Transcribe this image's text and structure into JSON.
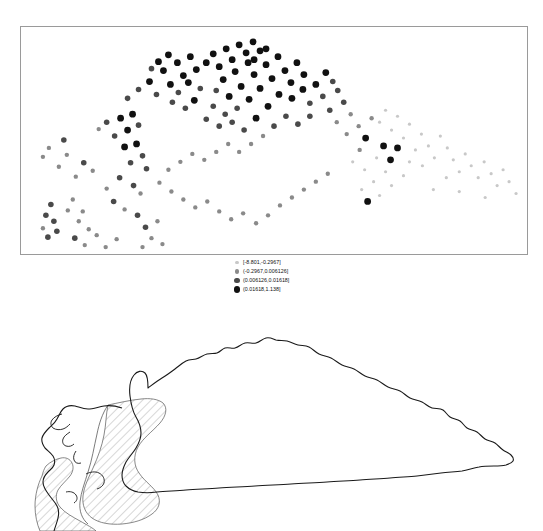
{
  "figure": {
    "title": "",
    "background_color": "#ffffff",
    "panel_border_color": "#9a9a9a",
    "map_outline_color": "#1a1a1a",
    "hatch_color": "#8c8c8c"
  },
  "legend": {
    "name": "choropleth-class-legend",
    "entries": [
      {
        "label": "[-8.801,-0.2967]",
        "marker": "circle",
        "color": "#c8c8c8",
        "size_px": 1.6
      },
      {
        "label": "(-0.2967,0.006126]",
        "marker": "circle",
        "color": "#8a8a8a",
        "size_px": 2.2
      },
      {
        "label": "(0.006126,0.01618]",
        "marker": "circle",
        "color": "#4a4a4a",
        "size_px": 2.8
      },
      {
        "label": "(0.01618,1.138]",
        "marker": "circle",
        "color": "#111111",
        "size_px": 3.4
      }
    ]
  },
  "chart_data": {
    "type": "scatter",
    "title": "",
    "xlabel": "",
    "ylabel": "",
    "xlim": [
      0,
      508
    ],
    "ylim": [
      0,
      229
    ],
    "grid": false,
    "axis_ticks": false,
    "legend_position": "below-panel-center",
    "class_breaks": [
      -8.801,
      -0.2967,
      0.006126,
      0.01618,
      1.138
    ],
    "class_names": [
      "[-8.801,-0.2967]",
      "(-0.2967,0.006126]",
      "(0.006126,0.01618]",
      "(0.01618,1.138]"
    ],
    "class_colors": [
      "#c8c8c8",
      "#8a8a8a",
      "#4a4a4a",
      "#111111"
    ],
    "class_sizes": [
      1.6,
      2.2,
      2.8,
      3.4
    ],
    "point_count": 186,
    "note": "Spatial scatter of residual values arranged in the crescent footprint of Cuba; x/y are panel pixel coordinates, cls is the legend class index 0-3.",
    "points": [
      {
        "x": 28,
        "y": 122,
        "cls": 1
      },
      {
        "x": 22,
        "y": 131,
        "cls": 1
      },
      {
        "x": 43,
        "y": 114,
        "cls": 2
      },
      {
        "x": 46,
        "y": 129,
        "cls": 1
      },
      {
        "x": 38,
        "y": 141,
        "cls": 1
      },
      {
        "x": 30,
        "y": 179,
        "cls": 2
      },
      {
        "x": 25,
        "y": 190,
        "cls": 2
      },
      {
        "x": 33,
        "y": 196,
        "cls": 2
      },
      {
        "x": 22,
        "y": 203,
        "cls": 1
      },
      {
        "x": 36,
        "y": 206,
        "cls": 2
      },
      {
        "x": 27,
        "y": 212,
        "cls": 2
      },
      {
        "x": 47,
        "y": 185,
        "cls": 1
      },
      {
        "x": 52,
        "y": 174,
        "cls": 1
      },
      {
        "x": 58,
        "y": 196,
        "cls": 1
      },
      {
        "x": 62,
        "y": 186,
        "cls": 1
      },
      {
        "x": 68,
        "y": 204,
        "cls": 1
      },
      {
        "x": 55,
        "y": 151,
        "cls": 1
      },
      {
        "x": 63,
        "y": 137,
        "cls": 2
      },
      {
        "x": 72,
        "y": 145,
        "cls": 1
      },
      {
        "x": 78,
        "y": 103,
        "cls": 1
      },
      {
        "x": 86,
        "y": 96,
        "cls": 2
      },
      {
        "x": 94,
        "y": 110,
        "cls": 2
      },
      {
        "x": 100,
        "y": 92,
        "cls": 3
      },
      {
        "x": 107,
        "y": 104,
        "cls": 3
      },
      {
        "x": 112,
        "y": 88,
        "cls": 3
      },
      {
        "x": 118,
        "y": 99,
        "cls": 2
      },
      {
        "x": 104,
        "y": 121,
        "cls": 3
      },
      {
        "x": 116,
        "y": 118,
        "cls": 3
      },
      {
        "x": 122,
        "y": 130,
        "cls": 2
      },
      {
        "x": 110,
        "y": 137,
        "cls": 2
      },
      {
        "x": 126,
        "y": 143,
        "cls": 2
      },
      {
        "x": 99,
        "y": 152,
        "cls": 2
      },
      {
        "x": 113,
        "y": 160,
        "cls": 2
      },
      {
        "x": 120,
        "y": 168,
        "cls": 1
      },
      {
        "x": 86,
        "y": 163,
        "cls": 1
      },
      {
        "x": 93,
        "y": 176,
        "cls": 2
      },
      {
        "x": 104,
        "y": 184,
        "cls": 1
      },
      {
        "x": 117,
        "y": 190,
        "cls": 2
      },
      {
        "x": 125,
        "y": 202,
        "cls": 2
      },
      {
        "x": 131,
        "y": 213,
        "cls": 1
      },
      {
        "x": 137,
        "y": 196,
        "cls": 1
      },
      {
        "x": 122,
        "y": 222,
        "cls": 1
      },
      {
        "x": 142,
        "y": 219,
        "cls": 1
      },
      {
        "x": 96,
        "y": 214,
        "cls": 1
      },
      {
        "x": 85,
        "y": 222,
        "cls": 1
      },
      {
        "x": 76,
        "y": 210,
        "cls": 1
      },
      {
        "x": 64,
        "y": 220,
        "cls": 1
      },
      {
        "x": 54,
        "y": 213,
        "cls": 2
      },
      {
        "x": 107,
        "y": 72,
        "cls": 2
      },
      {
        "x": 118,
        "y": 63,
        "cls": 2
      },
      {
        "x": 129,
        "y": 55,
        "cls": 3
      },
      {
        "x": 136,
        "y": 68,
        "cls": 2
      },
      {
        "x": 143,
        "y": 44,
        "cls": 3
      },
      {
        "x": 150,
        "y": 58,
        "cls": 3
      },
      {
        "x": 157,
        "y": 36,
        "cls": 3
      },
      {
        "x": 163,
        "y": 49,
        "cls": 3
      },
      {
        "x": 148,
        "y": 28,
        "cls": 3
      },
      {
        "x": 138,
        "y": 35,
        "cls": 3
      },
      {
        "x": 131,
        "y": 42,
        "cls": 2
      },
      {
        "x": 170,
        "y": 30,
        "cls": 3
      },
      {
        "x": 176,
        "y": 43,
        "cls": 3
      },
      {
        "x": 168,
        "y": 56,
        "cls": 3
      },
      {
        "x": 180,
        "y": 62,
        "cls": 2
      },
      {
        "x": 158,
        "y": 66,
        "cls": 2
      },
      {
        "x": 152,
        "y": 76,
        "cls": 2
      },
      {
        "x": 165,
        "y": 82,
        "cls": 2
      },
      {
        "x": 174,
        "y": 74,
        "cls": 3
      },
      {
        "x": 186,
        "y": 36,
        "cls": 3
      },
      {
        "x": 193,
        "y": 27,
        "cls": 3
      },
      {
        "x": 199,
        "y": 40,
        "cls": 3
      },
      {
        "x": 206,
        "y": 22,
        "cls": 3
      },
      {
        "x": 212,
        "y": 33,
        "cls": 3
      },
      {
        "x": 219,
        "y": 18,
        "cls": 3
      },
      {
        "x": 226,
        "y": 26,
        "cls": 3
      },
      {
        "x": 233,
        "y": 15,
        "cls": 3
      },
      {
        "x": 240,
        "y": 24,
        "cls": 3
      },
      {
        "x": 228,
        "y": 36,
        "cls": 3
      },
      {
        "x": 215,
        "y": 45,
        "cls": 3
      },
      {
        "x": 203,
        "y": 53,
        "cls": 3
      },
      {
        "x": 196,
        "y": 64,
        "cls": 2
      },
      {
        "x": 209,
        "y": 70,
        "cls": 3
      },
      {
        "x": 221,
        "y": 60,
        "cls": 3
      },
      {
        "x": 234,
        "y": 48,
        "cls": 3
      },
      {
        "x": 246,
        "y": 38,
        "cls": 3
      },
      {
        "x": 252,
        "y": 52,
        "cls": 3
      },
      {
        "x": 240,
        "y": 62,
        "cls": 3
      },
      {
        "x": 229,
        "y": 73,
        "cls": 3
      },
      {
        "x": 217,
        "y": 82,
        "cls": 2
      },
      {
        "x": 205,
        "y": 88,
        "cls": 2
      },
      {
        "x": 193,
        "y": 80,
        "cls": 2
      },
      {
        "x": 186,
        "y": 93,
        "cls": 2
      },
      {
        "x": 199,
        "y": 100,
        "cls": 2
      },
      {
        "x": 212,
        "y": 96,
        "cls": 2
      },
      {
        "x": 224,
        "y": 104,
        "cls": 2
      },
      {
        "x": 236,
        "y": 92,
        "cls": 3
      },
      {
        "x": 248,
        "y": 80,
        "cls": 3
      },
      {
        "x": 259,
        "y": 68,
        "cls": 3
      },
      {
        "x": 265,
        "y": 44,
        "cls": 3
      },
      {
        "x": 271,
        "y": 56,
        "cls": 3
      },
      {
        "x": 258,
        "y": 30,
        "cls": 3
      },
      {
        "x": 246,
        "y": 22,
        "cls": 3
      },
      {
        "x": 234,
        "y": 33,
        "cls": 3
      },
      {
        "x": 277,
        "y": 36,
        "cls": 3
      },
      {
        "x": 284,
        "y": 48,
        "cls": 3
      },
      {
        "x": 272,
        "y": 72,
        "cls": 3
      },
      {
        "x": 283,
        "y": 63,
        "cls": 3
      },
      {
        "x": 290,
        "y": 77,
        "cls": 2
      },
      {
        "x": 296,
        "y": 58,
        "cls": 3
      },
      {
        "x": 303,
        "y": 70,
        "cls": 2
      },
      {
        "x": 290,
        "y": 90,
        "cls": 2
      },
      {
        "x": 278,
        "y": 98,
        "cls": 2
      },
      {
        "x": 266,
        "y": 90,
        "cls": 2
      },
      {
        "x": 254,
        "y": 100,
        "cls": 2
      },
      {
        "x": 243,
        "y": 110,
        "cls": 1
      },
      {
        "x": 231,
        "y": 118,
        "cls": 1
      },
      {
        "x": 219,
        "y": 126,
        "cls": 1
      },
      {
        "x": 208,
        "y": 118,
        "cls": 1
      },
      {
        "x": 196,
        "y": 126,
        "cls": 1
      },
      {
        "x": 184,
        "y": 134,
        "cls": 1
      },
      {
        "x": 172,
        "y": 128,
        "cls": 1
      },
      {
        "x": 160,
        "y": 136,
        "cls": 1
      },
      {
        "x": 148,
        "y": 144,
        "cls": 1
      },
      {
        "x": 139,
        "y": 157,
        "cls": 1
      },
      {
        "x": 151,
        "y": 166,
        "cls": 1
      },
      {
        "x": 163,
        "y": 174,
        "cls": 1
      },
      {
        "x": 175,
        "y": 182,
        "cls": 1
      },
      {
        "x": 187,
        "y": 176,
        "cls": 1
      },
      {
        "x": 199,
        "y": 186,
        "cls": 1
      },
      {
        "x": 211,
        "y": 194,
        "cls": 1
      },
      {
        "x": 223,
        "y": 188,
        "cls": 1
      },
      {
        "x": 236,
        "y": 198,
        "cls": 1
      },
      {
        "x": 248,
        "y": 190,
        "cls": 1
      },
      {
        "x": 260,
        "y": 180,
        "cls": 1
      },
      {
        "x": 272,
        "y": 172,
        "cls": 1
      },
      {
        "x": 284,
        "y": 164,
        "cls": 1
      },
      {
        "x": 296,
        "y": 156,
        "cls": 1
      },
      {
        "x": 308,
        "y": 148,
        "cls": 1
      },
      {
        "x": 310,
        "y": 84,
        "cls": 2
      },
      {
        "x": 317,
        "y": 96,
        "cls": 1
      },
      {
        "x": 324,
        "y": 76,
        "cls": 2
      },
      {
        "x": 331,
        "y": 88,
        "cls": 1
      },
      {
        "x": 318,
        "y": 64,
        "cls": 2
      },
      {
        "x": 306,
        "y": 46,
        "cls": 3
      },
      {
        "x": 313,
        "y": 55,
        "cls": 2
      },
      {
        "x": 327,
        "y": 108,
        "cls": 1
      },
      {
        "x": 339,
        "y": 100,
        "cls": 1
      },
      {
        "x": 346,
        "y": 112,
        "cls": 3
      },
      {
        "x": 352,
        "y": 92,
        "cls": 1
      },
      {
        "x": 340,
        "y": 124,
        "cls": 1
      },
      {
        "x": 333,
        "y": 136,
        "cls": 0
      },
      {
        "x": 345,
        "y": 144,
        "cls": 0
      },
      {
        "x": 357,
        "y": 132,
        "cls": 0
      },
      {
        "x": 364,
        "y": 120,
        "cls": 3
      },
      {
        "x": 371,
        "y": 134,
        "cls": 3
      },
      {
        "x": 378,
        "y": 122,
        "cls": 3
      },
      {
        "x": 366,
        "y": 146,
        "cls": 0
      },
      {
        "x": 354,
        "y": 156,
        "cls": 0
      },
      {
        "x": 342,
        "y": 164,
        "cls": 0
      },
      {
        "x": 348,
        "y": 176,
        "cls": 3
      },
      {
        "x": 360,
        "y": 170,
        "cls": 0
      },
      {
        "x": 372,
        "y": 160,
        "cls": 0
      },
      {
        "x": 384,
        "y": 150,
        "cls": 0
      },
      {
        "x": 390,
        "y": 136,
        "cls": 0
      },
      {
        "x": 396,
        "y": 124,
        "cls": 0
      },
      {
        "x": 384,
        "y": 112,
        "cls": 0
      },
      {
        "x": 372,
        "y": 104,
        "cls": 0
      },
      {
        "x": 360,
        "y": 96,
        "cls": 0
      },
      {
        "x": 366,
        "y": 84,
        "cls": 0
      },
      {
        "x": 378,
        "y": 90,
        "cls": 0
      },
      {
        "x": 390,
        "y": 98,
        "cls": 0
      },
      {
        "x": 402,
        "y": 108,
        "cls": 0
      },
      {
        "x": 409,
        "y": 120,
        "cls": 0
      },
      {
        "x": 415,
        "y": 132,
        "cls": 0
      },
      {
        "x": 403,
        "y": 140,
        "cls": 0
      },
      {
        "x": 421,
        "y": 110,
        "cls": 0
      },
      {
        "x": 428,
        "y": 122,
        "cls": 0
      },
      {
        "x": 434,
        "y": 134,
        "cls": 0
      },
      {
        "x": 440,
        "y": 146,
        "cls": 0
      },
      {
        "x": 427,
        "y": 152,
        "cls": 0
      },
      {
        "x": 446,
        "y": 128,
        "cls": 0
      },
      {
        "x": 452,
        "y": 140,
        "cls": 0
      },
      {
        "x": 459,
        "y": 152,
        "cls": 0
      },
      {
        "x": 465,
        "y": 136,
        "cls": 0
      },
      {
        "x": 472,
        "y": 148,
        "cls": 0
      },
      {
        "x": 478,
        "y": 160,
        "cls": 0
      },
      {
        "x": 484,
        "y": 144,
        "cls": 0
      },
      {
        "x": 490,
        "y": 156,
        "cls": 0
      },
      {
        "x": 497,
        "y": 168,
        "cls": 0
      },
      {
        "x": 466,
        "y": 172,
        "cls": 0
      },
      {
        "x": 440,
        "y": 166,
        "cls": 0
      },
      {
        "x": 414,
        "y": 164,
        "cls": 0
      }
    ]
  },
  "map": {
    "name": "cuba-outline-map",
    "region_label": "",
    "hatched_regions": 2,
    "outline_stroke_width": 1.1
  }
}
